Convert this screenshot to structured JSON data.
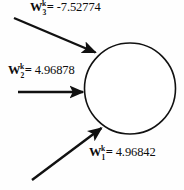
{
  "diagram": {
    "type": "neuron-weight-diagram",
    "node": {
      "shape": "circle",
      "fill": "#ffffff",
      "stroke": "#111111"
    },
    "inputs": [
      {
        "id": "w3",
        "symbol": "W",
        "superscript": "k",
        "subscript": "3",
        "equals": "=",
        "value": "-7.52774",
        "full_text": "Wᵏ₃= -7.52774",
        "arrow": "top-diagonal-arrow"
      },
      {
        "id": "w2",
        "symbol": "W",
        "superscript": "k",
        "subscript": "2",
        "equals": "=",
        "value": "4.96878",
        "full_text": "Wᵏ₂= 4.96878",
        "arrow": "middle-horizontal-arrow"
      },
      {
        "id": "w1",
        "symbol": "W",
        "superscript": "k",
        "subscript": "1",
        "equals": "=",
        "value": "4.96842",
        "full_text": "Wᵏ₁= 4.96842",
        "arrow": "bottom-diagonal-arrow"
      }
    ],
    "colors": {
      "ink": "#111111",
      "background": "#fefefe"
    }
  }
}
